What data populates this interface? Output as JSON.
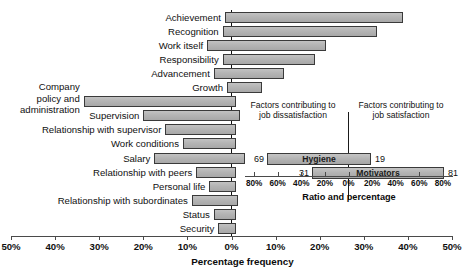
{
  "chart_data": {
    "type": "bar",
    "title": "",
    "xlabel": "Percentage frequency",
    "ylabel": "",
    "xlim": [
      -50,
      50
    ],
    "grid": false,
    "orientation": "horizontal",
    "note": "Diverging horizontal bar chart: each factor bar spans from a dissatisfaction percentage (left of 0%) to a satisfaction percentage (right of 0%).",
    "axis_ticks": [
      {
        "label": "50%",
        "value": -50
      },
      {
        "label": "40%",
        "value": -40
      },
      {
        "label": "30%",
        "value": -30
      },
      {
        "label": "20%",
        "value": -20
      },
      {
        "label": "10%",
        "value": -10
      },
      {
        "label": "0%",
        "value": 0
      },
      {
        "label": "10%",
        "value": 10
      },
      {
        "label": "20%",
        "value": 20
      },
      {
        "label": "30%",
        "value": 30
      },
      {
        "label": "40%",
        "value": 40
      },
      {
        "label": "50%",
        "value": 50
      }
    ],
    "categories": [
      "Achievement",
      "Recognition",
      "Work itself",
      "Responsibility",
      "Advancement",
      "Growth",
      "Company policy and administration",
      "Supervision",
      "Relationship with supervisor",
      "Work conditions",
      "Salary",
      "Relationship with peers",
      "Personal life",
      "Relationship with subordinates",
      "Status",
      "Security"
    ],
    "bars": [
      {
        "label": "Achievement",
        "left": -1.5,
        "right": 39.0
      },
      {
        "label": "Recognition",
        "left": -2.0,
        "right": 33.0
      },
      {
        "label": "Work itself",
        "left": -5.5,
        "right": 21.5
      },
      {
        "label": "Responsibility",
        "left": -2.0,
        "right": 19.0
      },
      {
        "label": "Advancement",
        "left": -4.0,
        "right": 12.0
      },
      {
        "label": "Growth",
        "left": -1.0,
        "right": 7.0
      },
      {
        "label": "Company policy and administration",
        "left": -33.5,
        "right": 1.0
      },
      {
        "label": "Supervision",
        "left": -20.0,
        "right": 2.0
      },
      {
        "label": "Relationship with supervisor",
        "left": -15.0,
        "right": 1.0
      },
      {
        "label": "Work conditions",
        "left": -11.0,
        "right": 1.0
      },
      {
        "label": "Salary",
        "left": -17.5,
        "right": 3.0
      },
      {
        "label": "Relationship with peers",
        "left": -8.0,
        "right": 1.0
      },
      {
        "label": "Personal life",
        "left": -5.0,
        "right": 1.0
      },
      {
        "label": "Relationship with subordinates",
        "left": -9.0,
        "right": 1.5
      },
      {
        "label": "Status",
        "left": -4.0,
        "right": 1.0
      },
      {
        "label": "Security",
        "left": -3.0,
        "right": 1.0
      }
    ]
  },
  "inset": {
    "type": "bar",
    "title": "Ratio and percentage",
    "caption_left": "Factors contributing to job dissatisfaction",
    "caption_right": "Factors contributing to job satisfaction",
    "xlim": [
      -90,
      90
    ],
    "axis_ticks": [
      {
        "label": "80%",
        "value": -80
      },
      {
        "label": "60%",
        "value": -60
      },
      {
        "label": "40%",
        "value": -40
      },
      {
        "label": "20%",
        "value": -20
      },
      {
        "label": "0%",
        "value": 0
      },
      {
        "label": "20%",
        "value": 20
      },
      {
        "label": "40%",
        "value": 40
      },
      {
        "label": "60%",
        "value": 60
      },
      {
        "label": "80%",
        "value": 80
      }
    ],
    "bars": [
      {
        "label": "Hygiene",
        "left": 69,
        "right": 19,
        "left_value": "69",
        "right_value": "19"
      },
      {
        "label": "Motivators",
        "left": 31,
        "right": 81,
        "left_value": "31",
        "right_value": "81"
      }
    ]
  },
  "colors": {
    "bar_fill": "#b4b4b4",
    "bar_stroke": "#3a3a3a",
    "axis": "#4a4a4a",
    "text": "#101010",
    "background": "#ffffff"
  }
}
